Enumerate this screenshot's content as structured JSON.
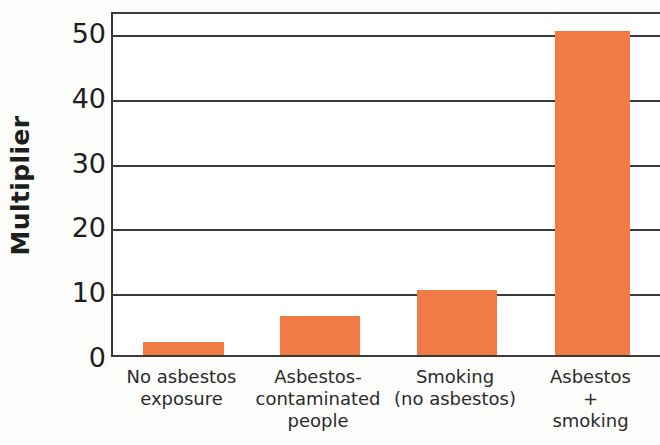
{
  "chart_data": {
    "type": "bar",
    "title": "",
    "subtitle": "",
    "xlabel": "",
    "ylabel": "Multiplier",
    "ylim": [
      0,
      53
    ],
    "yticks": [
      0,
      10,
      20,
      30,
      40,
      50
    ],
    "ytick_labels": [
      "0",
      "10",
      "20",
      "30",
      "40",
      "50"
    ],
    "grid": "horizontal",
    "legend": "none",
    "bar_color": "#f07b45",
    "axis_color": "#3a3a3a",
    "categories": [
      "No asbestos exposure",
      "Asbestos-contaminated people",
      "Smoking (no asbestos)",
      "Asbestos + smoking"
    ],
    "category_lines": [
      [
        "No asbestos",
        "exposure"
      ],
      [
        "Asbestos-",
        "contaminated",
        "people"
      ],
      [
        "Smoking",
        "(no asbestos)"
      ],
      [
        "Asbestos",
        "+",
        "smoking"
      ]
    ],
    "values": [
      2,
      6,
      10,
      50
    ]
  }
}
